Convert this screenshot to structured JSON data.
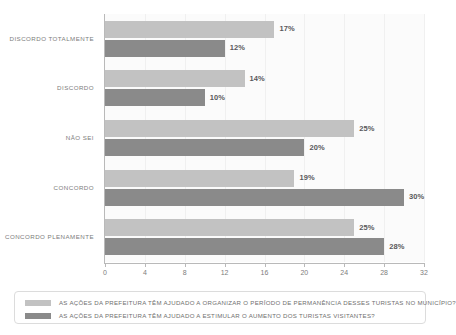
{
  "chart_data": {
    "type": "bar",
    "orientation": "horizontal",
    "title": "",
    "xlabel": "",
    "ylabel": "",
    "xlim": [
      0,
      32
    ],
    "xticks": [
      0,
      4,
      8,
      12,
      16,
      20,
      24,
      28,
      32
    ],
    "grid": true,
    "grid_axis": "x",
    "legend_position": "bottom",
    "categories": [
      "DISCORDO TOTALMENTE",
      "DISCORDO",
      "NÃO SEI",
      "CONCORDO",
      "CONCORDO PLENAMENTE"
    ],
    "series": [
      {
        "name": "AS AÇÕES DA PREFEITURA TÊM AJUDADO A ORGANIZAR O PERÍODO DE PERMANÊNCIA DESSES TURISTAS NO MUNICÍPIO?",
        "color": "#c2c2c2",
        "values": [
          17,
          14,
          25,
          19,
          25
        ],
        "labels": [
          "17%",
          "14%",
          "25%",
          "19%",
          "25%"
        ]
      },
      {
        "name": "AS AÇÕES DA PREFEITURA TÊM AJUDADO A ESTIMULAR O AUMENTO DOS TURISTAS VISITANTES?",
        "color": "#8a8a8a",
        "values": [
          12,
          10,
          20,
          30,
          28
        ],
        "labels": [
          "12%",
          "10%",
          "20%",
          "30%",
          "28%"
        ]
      }
    ]
  },
  "legend": {
    "entries": [
      {
        "swatch_color": "#c2c2c2",
        "label": "AS AÇÕES DA PREFEITURA TÊM AJUDADO A ORGANIZAR O PERÍODO DE PERMANÊNCIA DESSES TURISTAS NO MUNICÍPIO?"
      },
      {
        "swatch_color": "#8a8a8a",
        "label": "AS AÇÕES DA PREFEITURA TÊM AJUDADO A ESTIMULAR O AUMENTO DOS TURISTAS VISITANTES?"
      }
    ]
  }
}
